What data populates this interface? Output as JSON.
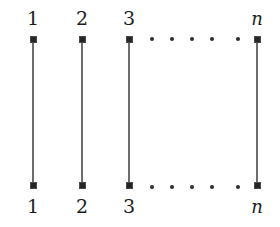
{
  "figure": {
    "title": "",
    "background_color": "#ffffff",
    "width": 280,
    "height": 227,
    "node_color": "#262626",
    "edge_color": "#6d6d6d",
    "dot_color": "#2c2c2c",
    "label_color": "#1c1c1c"
  },
  "graph": {
    "type": "matching",
    "description": "n disjoint vertical edges joining top vertices 1,2,3,...,n to bottom vertices 1,2,3,...,n",
    "top_labels": [
      "1",
      "2",
      "3",
      "n"
    ],
    "bottom_labels": [
      "1",
      "2",
      "3",
      "n"
    ],
    "columns": [
      {
        "label_top": "1",
        "label_bottom": "1",
        "x": 33,
        "italic": false
      },
      {
        "label_top": "2",
        "label_bottom": "2",
        "x": 82,
        "italic": false
      },
      {
        "label_top": "3",
        "label_bottom": "3",
        "x": 129,
        "italic": false
      },
      {
        "label_top": "n",
        "label_bottom": "n",
        "x": 257,
        "italic": true
      }
    ],
    "node_rows": {
      "top_y": 39,
      "bottom_y": 185
    },
    "edges": [
      {
        "from_x": 33,
        "top_y": 39,
        "bottom_y": 185
      },
      {
        "from_x": 82,
        "top_y": 39,
        "bottom_y": 185
      },
      {
        "from_x": 129,
        "top_y": 39,
        "bottom_y": 185
      },
      {
        "from_x": 257,
        "top_y": 39,
        "bottom_y": 185
      }
    ],
    "ellipsis_top": {
      "y": 39,
      "dots_x": [
        152,
        172,
        192,
        212,
        238
      ]
    },
    "ellipsis_bottom": {
      "y": 187,
      "dots_x": [
        152,
        172,
        192,
        212,
        238
      ]
    }
  }
}
